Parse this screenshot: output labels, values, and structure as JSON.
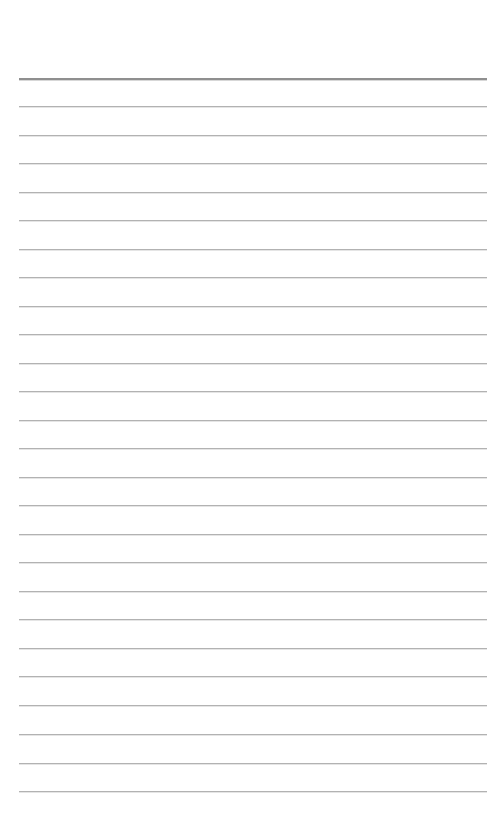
{
  "page": {
    "name": "lined-notepad-page",
    "width": 498,
    "height": 830,
    "background_color": "#ffffff",
    "content_text": ""
  },
  "ruling": {
    "line_count": 26,
    "first_line_y": 78,
    "line_spacing": 28.52,
    "line_left_x": 19,
    "line_right_x": 487,
    "line_width": 468,
    "margin_top": 78,
    "margin_bottom": 39,
    "margin_left": 19,
    "margin_right": 11,
    "body_line_color": "#b2b2b2",
    "body_line_thickness": 1,
    "header_line_color": "#8f8f8f",
    "header_line_thickness": 2,
    "header_line_index": 0,
    "lines": [
      {
        "index": 0,
        "y": 78,
        "role": "header-rule",
        "color": "#8f8f8f",
        "thickness": 2
      },
      {
        "index": 1,
        "y": 106,
        "role": "writing-rule",
        "color": "#b2b2b2",
        "thickness": 1
      },
      {
        "index": 2,
        "y": 135,
        "role": "writing-rule",
        "color": "#b2b2b2",
        "thickness": 1
      },
      {
        "index": 3,
        "y": 163,
        "role": "writing-rule",
        "color": "#b2b2b2",
        "thickness": 1
      },
      {
        "index": 4,
        "y": 192,
        "role": "writing-rule",
        "color": "#b2b2b2",
        "thickness": 1
      },
      {
        "index": 5,
        "y": 220,
        "role": "writing-rule",
        "color": "#b2b2b2",
        "thickness": 1
      },
      {
        "index": 6,
        "y": 249,
        "role": "writing-rule",
        "color": "#b2b2b2",
        "thickness": 1
      },
      {
        "index": 7,
        "y": 277,
        "role": "writing-rule",
        "color": "#b2b2b2",
        "thickness": 1
      },
      {
        "index": 8,
        "y": 306,
        "role": "writing-rule",
        "color": "#b2b2b2",
        "thickness": 1
      },
      {
        "index": 9,
        "y": 334,
        "role": "writing-rule",
        "color": "#b2b2b2",
        "thickness": 1
      },
      {
        "index": 10,
        "y": 363,
        "role": "writing-rule",
        "color": "#b2b2b2",
        "thickness": 1
      },
      {
        "index": 11,
        "y": 391,
        "role": "writing-rule",
        "color": "#b2b2b2",
        "thickness": 1
      },
      {
        "index": 12,
        "y": 420,
        "role": "writing-rule",
        "color": "#b2b2b2",
        "thickness": 1
      },
      {
        "index": 13,
        "y": 448,
        "role": "writing-rule",
        "color": "#b2b2b2",
        "thickness": 1
      },
      {
        "index": 14,
        "y": 477,
        "role": "writing-rule",
        "color": "#b2b2b2",
        "thickness": 1
      },
      {
        "index": 15,
        "y": 505,
        "role": "writing-rule",
        "color": "#b2b2b2",
        "thickness": 1
      },
      {
        "index": 16,
        "y": 534,
        "role": "writing-rule",
        "color": "#b2b2b2",
        "thickness": 1
      },
      {
        "index": 17,
        "y": 562,
        "role": "writing-rule",
        "color": "#b2b2b2",
        "thickness": 1
      },
      {
        "index": 18,
        "y": 591,
        "role": "writing-rule",
        "color": "#b2b2b2",
        "thickness": 1
      },
      {
        "index": 19,
        "y": 619,
        "role": "writing-rule",
        "color": "#b2b2b2",
        "thickness": 1
      },
      {
        "index": 20,
        "y": 648,
        "role": "writing-rule",
        "color": "#b2b2b2",
        "thickness": 1
      },
      {
        "index": 21,
        "y": 676,
        "role": "writing-rule",
        "color": "#b2b2b2",
        "thickness": 1
      },
      {
        "index": 22,
        "y": 705,
        "role": "writing-rule",
        "color": "#b2b2b2",
        "thickness": 1
      },
      {
        "index": 23,
        "y": 734,
        "role": "writing-rule",
        "color": "#b2b2b2",
        "thickness": 1
      },
      {
        "index": 24,
        "y": 763,
        "role": "writing-rule",
        "color": "#b2b2b2",
        "thickness": 1
      },
      {
        "index": 25,
        "y": 791,
        "role": "writing-rule",
        "color": "#b2b2b2",
        "thickness": 1
      }
    ]
  }
}
